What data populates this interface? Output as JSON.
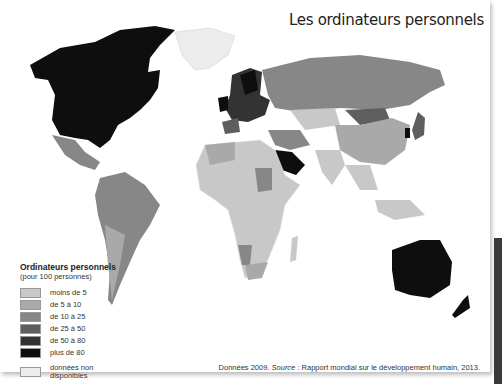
{
  "title": "Les ordinateurs personnels",
  "legend": {
    "title": "Ordinateurs personnels",
    "subtitle": "(pour 100 personnes)",
    "items": [
      {
        "label": "moins de 5",
        "color": "#c8c8c8"
      },
      {
        "label": "de 5 à 10",
        "color": "#a9a9a9"
      },
      {
        "label": "de 10 à 25",
        "color": "#878787"
      },
      {
        "label": "de 25 à 50",
        "color": "#5e5e5e"
      },
      {
        "label": "de 50 à 80",
        "color": "#333333"
      },
      {
        "label": "plus de 80",
        "color": "#0e0e0e"
      },
      {
        "label": "données non disponibles",
        "color": "#ececec"
      }
    ]
  },
  "source": {
    "prefix": "Données  2009. ",
    "source_label": "Source",
    "text": " : Rapport mondial sur le développement humain, 2013."
  },
  "regions": [
    {
      "name": "Amérique du Nord (États-Unis, Canada)",
      "class": "plus de 80"
    },
    {
      "name": "Groenland",
      "class": "données non disponibles"
    },
    {
      "name": "Europe du Nord et de l'Ouest",
      "class": "de 50 à 80 / plus de 80"
    },
    {
      "name": "Russie",
      "class": "de 10 à 25"
    },
    {
      "name": "Mongolie",
      "class": "de 25 à 50"
    },
    {
      "name": "Chine",
      "class": "de 5 à 10"
    },
    {
      "name": "Japon",
      "class": "de 25 à 50"
    },
    {
      "name": "Corée du Sud",
      "class": "plus de 80"
    },
    {
      "name": "Arabie saoudite",
      "class": "plus de 80"
    },
    {
      "name": "Soudan",
      "class": "de 10 à 25"
    },
    {
      "name": "Namibie",
      "class": "de 10 à 25"
    },
    {
      "name": "Brésil",
      "class": "de 10 à 25"
    },
    {
      "name": "Afrique",
      "class": "moins de 5"
    },
    {
      "name": "Inde",
      "class": "moins de 5"
    },
    {
      "name": "Australie",
      "class": "plus de 80"
    },
    {
      "name": "Nouvelle-Zélande",
      "class": "plus de 80"
    }
  ]
}
